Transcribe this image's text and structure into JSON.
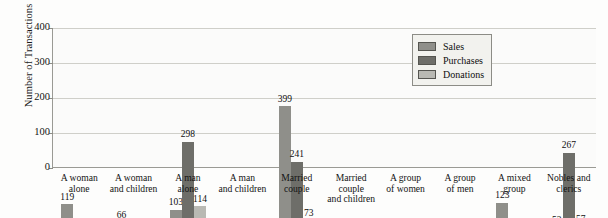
{
  "chart_data": {
    "type": "bar",
    "title": "",
    "xlabel": "",
    "ylabel": "Number of Transactions",
    "ylim": [
      0,
      400
    ],
    "yticks": [
      0,
      100,
      200,
      300,
      400
    ],
    "grid": true,
    "legend_position": "upper-right",
    "categories": [
      "A woman alone",
      "A woman and children",
      "A man alone",
      "A man and children",
      "Married couple",
      "Married couple and children",
      "A group of women",
      "A group of men",
      "A mixed group",
      "Nobles and clerics"
    ],
    "category_lines": [
      [
        "A woman",
        "alone"
      ],
      [
        "A woman",
        "and children"
      ],
      [
        "A man",
        "alone"
      ],
      [
        "A man",
        "and children"
      ],
      [
        "Married",
        "couple"
      ],
      [
        "Married",
        "couple",
        "and children"
      ],
      [
        "A group",
        "of women"
      ],
      [
        "A group",
        "of men"
      ],
      [
        "A mixed",
        "group"
      ],
      [
        "Nobles and",
        "clerics"
      ]
    ],
    "series": [
      {
        "name": "Sales",
        "color": "#8f8f8a",
        "values": [
          119,
          66,
          103,
          8,
          399,
          12,
          15,
          12,
          123,
          52
        ]
      },
      {
        "name": "Purchases",
        "color": "#6e6e69",
        "values": [
          42,
          6,
          298,
          1,
          241,
          1,
          4,
          29,
          20,
          267
        ]
      },
      {
        "name": "Donations",
        "color": "#b9b9b3",
        "values": [
          24,
          14,
          114,
          0,
          73,
          0,
          0,
          7,
          14,
          57
        ]
      }
    ],
    "legend": [
      "Sales",
      "Purchases",
      "Donations"
    ]
  }
}
